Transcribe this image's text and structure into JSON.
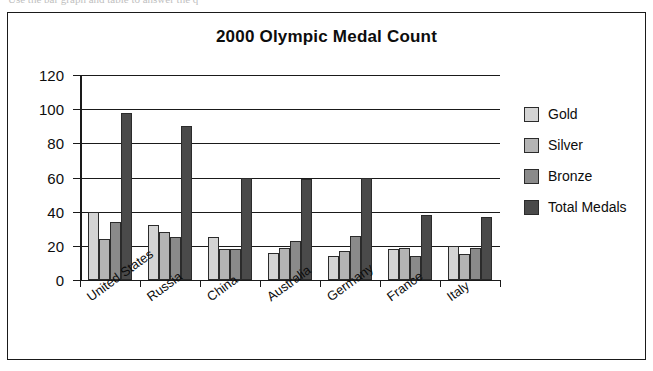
{
  "scan": {
    "top_partial_text": "Use the bar graph and table to answer the q"
  },
  "legend": {
    "position": "right",
    "entries": [
      {
        "label": "Gold",
        "color": "#d4d4d4"
      },
      {
        "label": "Silver",
        "color": "#b4b4b4"
      },
      {
        "label": "Bronze",
        "color": "#8a8a8a"
      },
      {
        "label": "Total Medals",
        "color": "#4a4a4a"
      }
    ]
  },
  "chart_data": {
    "type": "bar",
    "title": "2000 Olympic Medal Count",
    "xlabel": "",
    "ylabel": "",
    "ylim": [
      0,
      120
    ],
    "yticks": [
      0,
      20,
      40,
      60,
      80,
      100,
      120
    ],
    "grid": true,
    "legend_position": "right",
    "categories": [
      "United States",
      "Russia",
      "China",
      "Australia",
      "Germany",
      "France",
      "Italy"
    ],
    "series": [
      {
        "name": "Gold",
        "color": "#d4d4d4",
        "values": [
          40,
          32,
          25,
          16,
          14,
          18,
          20
        ]
      },
      {
        "name": "Silver",
        "color": "#b4b4b4",
        "values": [
          24,
          28,
          18,
          19,
          17,
          19,
          15
        ]
      },
      {
        "name": "Bronze",
        "color": "#8a8a8a",
        "values": [
          34,
          25,
          18,
          23,
          26,
          14,
          19
        ]
      },
      {
        "name": "Total Medals",
        "color": "#4a4a4a",
        "values": [
          98,
          90,
          60,
          59,
          60,
          38,
          37
        ]
      }
    ]
  }
}
